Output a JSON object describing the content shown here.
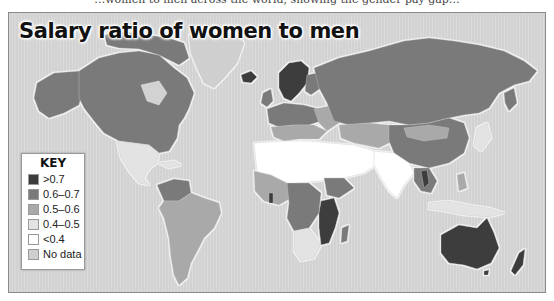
{
  "figure": {
    "title": "Salary ratio of women to men",
    "caption_fragment_above": "…women to men across the world, showing the gender pay gap…"
  },
  "legend": {
    "title": "KEY",
    "items": [
      {
        "label": ">0.7",
        "color": "#3c3c3c"
      },
      {
        "label": "0.6–0.7",
        "color": "#7a7a7a"
      },
      {
        "label": "0.5–0.6",
        "color": "#a9a9a9"
      },
      {
        "label": "0.4–0.5",
        "color": "#e3e3e3"
      },
      {
        "label": "<0.4",
        "color": "#ffffff"
      },
      {
        "label": "No data",
        "color": "#cfcfcf"
      }
    ]
  },
  "colors": {
    "ocean": "#d2d2d2",
    "frame_border": "#8a8a8a",
    "coast_glow": "#f2f2f2"
  },
  "regions": [
    {
      "name": "Canada & USA",
      "class": "0.6–0.7"
    },
    {
      "name": "Alaska",
      "class": "0.6–0.7"
    },
    {
      "name": "Greenland",
      "class": "No data"
    },
    {
      "name": "Iceland",
      "class": ">0.7"
    },
    {
      "name": "Scandinavia",
      "class": ">0.7"
    },
    {
      "name": "Russia",
      "class": "0.6–0.7"
    },
    {
      "name": "Mongolia",
      "class": "0.5–0.6"
    },
    {
      "name": "China",
      "class": "0.6–0.7"
    },
    {
      "name": "Western Europe",
      "class": "0.6–0.7"
    },
    {
      "name": "Southern Europe",
      "class": "0.5–0.6"
    },
    {
      "name": "North Africa & Middle East",
      "class": "<0.4"
    },
    {
      "name": "South Asia",
      "class": "<0.4"
    },
    {
      "name": "West Africa",
      "class": "0.5–0.6"
    },
    {
      "name": "Central Africa",
      "class": "0.6–0.7"
    },
    {
      "name": "East Africa (Tanzania/Mozambique)",
      "class": ">0.7"
    },
    {
      "name": "Southern Africa",
      "class": "0.4–0.5"
    },
    {
      "name": "Madagascar",
      "class": "0.6–0.7"
    },
    {
      "name": "Mexico & Central America",
      "class": "0.4–0.5"
    },
    {
      "name": "Colombia/Venezuela",
      "class": "0.6–0.7"
    },
    {
      "name": "South America",
      "class": "0.5–0.6"
    },
    {
      "name": "Southeast Asia",
      "class": "0.6–0.7"
    },
    {
      "name": "Japan",
      "class": "0.4–0.5"
    },
    {
      "name": "Australia",
      "class": ">0.7"
    },
    {
      "name": "New Zealand",
      "class": ">0.7"
    }
  ]
}
